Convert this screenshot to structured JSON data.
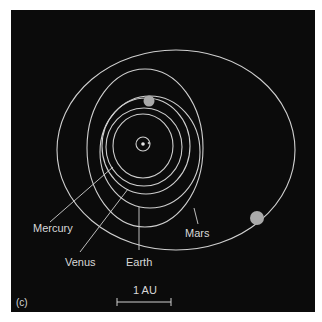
{
  "figure": {
    "panel_label": "(c)",
    "scale_bar_label": "1 AU",
    "background_color": "#0b0b0b",
    "orbit_color": "#cfcfcf",
    "planet_color": "#a9a9a9"
  },
  "labels": {
    "mercury": "Mercury",
    "venus": "Venus",
    "earth": "Earth",
    "mars": "Mars"
  },
  "bodies": [
    {
      "name": "Sun"
    },
    {
      "name": "Mercury"
    },
    {
      "name": "Venus"
    },
    {
      "name": "Earth"
    },
    {
      "name": "Mars"
    }
  ]
}
